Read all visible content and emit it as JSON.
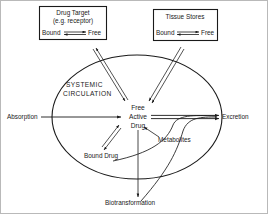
{
  "diagram": {
    "stroke_color": "#1a1a1a",
    "background_color": "#ffffff",
    "border_color": "#b9b9b9",
    "boxes": [
      {
        "id": "drug-target",
        "title": "Drug Target",
        "subtitle": "(e.g. receptor)",
        "equilibrium_left": "Bound",
        "equilibrium_right": "Free",
        "equilibrium_symbol": "double-headed-equilibrium-arrow"
      },
      {
        "id": "tissue-stores",
        "title": "Tissue Stores",
        "subtitle": "",
        "equilibrium_left": "Bound",
        "equilibrium_right": "Free",
        "equilibrium_symbol": "double-headed-equilibrium-arrow"
      }
    ],
    "compartment": {
      "shape": "ellipse",
      "label_line1": "SYSTEMIC",
      "label_line2": "CIRCULATION"
    },
    "center": {
      "line1": "Free",
      "line2": "Active",
      "line3": "Drug"
    },
    "nodes": {
      "absorption": "Absorption",
      "excretion": "Excretion",
      "bound_drug": "Bound Drug",
      "metabolites": "Metabolites",
      "biotransformation": "Biotransformation"
    }
  }
}
